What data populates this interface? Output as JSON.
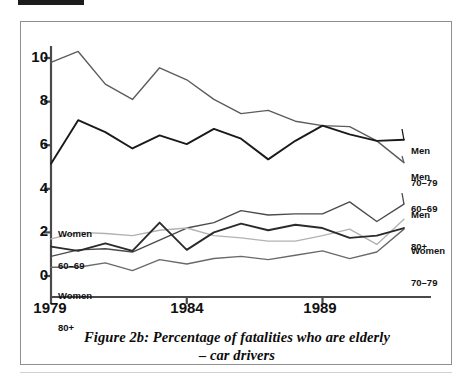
{
  "figure": {
    "caption_line1": "Figure 2b: Percentage of fatalities who are elderly",
    "caption_line2": "– car drivers"
  },
  "chart_data": {
    "type": "line",
    "title": "Figure 2b: Percentage of fatalities who are elderly – car drivers",
    "xlabel": "",
    "ylabel": "",
    "xlim": [
      1979,
      1992
    ],
    "ylim": [
      0,
      11
    ],
    "grid": false,
    "legend_position": "inline-right",
    "x": [
      1979,
      1980,
      1981,
      1982,
      1983,
      1984,
      1985,
      1986,
      1987,
      1988,
      1989,
      1990,
      1991,
      1992
    ],
    "x_ticks": [
      1979,
      1984,
      1989
    ],
    "x_tick_labels": [
      "1979",
      "1984",
      "1989"
    ],
    "y_ticks": [
      0,
      2,
      4,
      6,
      8,
      10
    ],
    "y_tick_labels": [
      "0",
      "2",
      "4",
      "6",
      "8",
      "10"
    ],
    "series": [
      {
        "name": "Men 60–69",
        "label_line1": "Men",
        "label_line2": "60–69",
        "color": "#5c5c5c",
        "values": [
          9.8,
          10.3,
          8.8,
          8.1,
          9.55,
          9.0,
          8.1,
          7.45,
          7.6,
          7.1,
          6.9,
          6.85,
          6.2,
          5.2
        ]
      },
      {
        "name": "Men 70–79",
        "label_line1": "Men",
        "label_line2": "70–79",
        "color": "#1a1a1a",
        "values": [
          5.15,
          7.15,
          6.6,
          5.85,
          6.45,
          6.05,
          6.75,
          6.3,
          5.35,
          6.2,
          6.9,
          6.5,
          6.2,
          6.25
        ]
      },
      {
        "name": "Men 80+",
        "label_line1": "Men",
        "label_line2": "80+",
        "color": "#4b4b4b",
        "values": [
          0.9,
          1.2,
          1.25,
          1.1,
          1.65,
          2.2,
          2.45,
          3.0,
          2.8,
          2.85,
          2.85,
          3.4,
          2.5,
          3.3
        ]
      },
      {
        "name": "Women 60–69",
        "label_line1": "Women",
        "label_line2": "60–69",
        "color": "#b2b2b2",
        "values": [
          1.7,
          2.0,
          1.95,
          1.85,
          2.1,
          2.2,
          1.85,
          1.75,
          1.6,
          1.6,
          1.85,
          2.15,
          1.45,
          2.6
        ]
      },
      {
        "name": "Women 70–79",
        "label_line1": "Women",
        "label_line2": "70–79",
        "color": "#2b2b2b",
        "values": [
          1.35,
          1.15,
          1.5,
          1.15,
          2.45,
          1.2,
          2.0,
          2.4,
          2.1,
          2.35,
          2.2,
          1.75,
          1.85,
          2.2
        ]
      },
      {
        "name": "Women 80+",
        "label_line1": "Women",
        "label_line2": "80+",
        "color": "#6a6a6a",
        "values": [
          0.4,
          0.4,
          0.6,
          0.25,
          0.75,
          0.55,
          0.8,
          0.9,
          0.75,
          0.95,
          1.15,
          0.8,
          1.1,
          2.15
        ]
      }
    ]
  },
  "axes": {
    "y_labels": [
      "10",
      "8",
      "6",
      "4",
      "2",
      "0"
    ],
    "x_labels": [
      "1979",
      "1984",
      "1989"
    ]
  },
  "annotations": {
    "men_60_69": {
      "line1": "Men",
      "line2": "60–69"
    },
    "men_70_79": {
      "line1": "Men",
      "line2": "70–79"
    },
    "men_80_plus": {
      "line1": "Men",
      "line2": "80+"
    },
    "women_60_69": {
      "line1": "Women",
      "line2": "60–69"
    },
    "women_70_79": {
      "line1": "Women",
      "line2": "70–79"
    },
    "women_80_plus": {
      "line1": "Women",
      "line2": "80+"
    }
  }
}
